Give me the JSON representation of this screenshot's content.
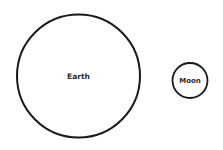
{
  "diagram": {
    "nodes": [
      {
        "id": "earth",
        "label": "Earth",
        "cx": 78.5,
        "cy": 76,
        "r": 61.5
      },
      {
        "id": "moon",
        "label": "Moon",
        "cx": 190,
        "cy": 80.5,
        "r": 17.5
      }
    ],
    "stroke_color": "#1a1a1a",
    "background": "#ffffff"
  }
}
